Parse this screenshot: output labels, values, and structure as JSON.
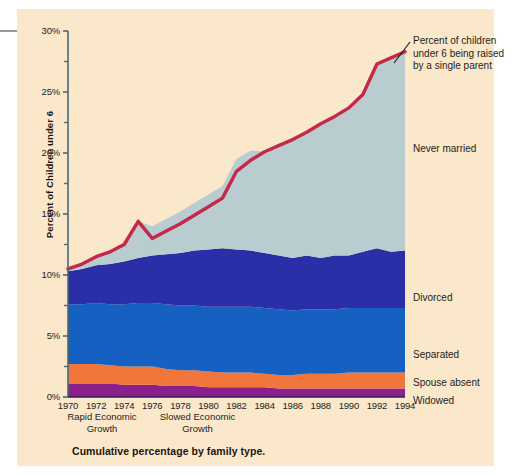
{
  "figure": {
    "caption": "Cumulative percentage by family type.",
    "y_axis_title": "Percent of Children under 6",
    "callout": "Percent of children under 6 being raised by a single parent",
    "era_notes": [
      {
        "line1": "Rapid Economic",
        "line2": "Growth"
      },
      {
        "line1": "Slowed Economic",
        "line2": "Growth"
      }
    ]
  },
  "colors": {
    "panel_background": "#fbe7c9",
    "never_married": "#b9cdd0",
    "divorced": "#2a2fa8",
    "separated": "#1560c0",
    "spouse_absent": "#f0763c",
    "widowed": "#8b1f8c",
    "trend_line": "#c2294a",
    "axis": "#4a6a78",
    "text": "#231f1c",
    "top_rule": "#9a9a9a"
  },
  "chart_data": {
    "type": "area",
    "title": "Cumulative percentage by family type.",
    "xlabel": "",
    "ylabel": "Percent of Children under 6",
    "xlim": [
      1970,
      1994
    ],
    "ylim": [
      0,
      30
    ],
    "ytick_labels": [
      "0%",
      "5%",
      "10%",
      "15%",
      "20%",
      "25%",
      "30%"
    ],
    "ytick_values": [
      0,
      5,
      10,
      15,
      20,
      25,
      30
    ],
    "yminor_values": [
      2.5,
      7.5,
      12.5,
      17.5,
      22.5,
      27.5
    ],
    "xtick_labels": [
      "1970",
      "1972",
      "1974",
      "1976",
      "1978",
      "1980",
      "1982",
      "1984",
      "1986",
      "1988",
      "1990",
      "1992",
      "1994"
    ],
    "xtick_values": [
      1970,
      1972,
      1974,
      1976,
      1978,
      1980,
      1982,
      1984,
      1986,
      1988,
      1990,
      1992,
      1994
    ],
    "grid": false,
    "legend_position": "right-inline",
    "x": [
      1970,
      1971,
      1972,
      1973,
      1974,
      1975,
      1976,
      1977,
      1978,
      1979,
      1980,
      1981,
      1982,
      1983,
      1984,
      1985,
      1986,
      1987,
      1988,
      1989,
      1990,
      1991,
      1992,
      1993,
      1994
    ],
    "series": [
      {
        "name": "Widowed",
        "color": "#8b1f8c",
        "values": [
          1.1,
          1.1,
          1.1,
          1.1,
          1.0,
          1.0,
          1.0,
          0.9,
          0.9,
          0.9,
          0.8,
          0.8,
          0.8,
          0.8,
          0.8,
          0.7,
          0.7,
          0.7,
          0.7,
          0.7,
          0.7,
          0.7,
          0.7,
          0.7,
          0.7
        ]
      },
      {
        "name": "Spouse absent",
        "color": "#f0763c",
        "values": [
          1.6,
          1.6,
          1.6,
          1.5,
          1.5,
          1.5,
          1.5,
          1.4,
          1.3,
          1.3,
          1.3,
          1.2,
          1.2,
          1.2,
          1.1,
          1.1,
          1.1,
          1.2,
          1.2,
          1.2,
          1.3,
          1.3,
          1.3,
          1.3,
          1.3
        ]
      },
      {
        "name": "Separated",
        "color": "#1560c0",
        "values": [
          4.9,
          4.9,
          5.0,
          5.0,
          5.1,
          5.2,
          5.2,
          5.3,
          5.3,
          5.3,
          5.3,
          5.4,
          5.4,
          5.4,
          5.4,
          5.4,
          5.3,
          5.3,
          5.3,
          5.3,
          5.3,
          5.3,
          5.3,
          5.3,
          5.3
        ]
      },
      {
        "name": "Divorced",
        "color": "#2a2fa8",
        "values": [
          2.7,
          2.9,
          3.1,
          3.3,
          3.5,
          3.7,
          3.9,
          4.1,
          4.3,
          4.5,
          4.7,
          4.8,
          4.7,
          4.6,
          4.5,
          4.4,
          4.3,
          4.4,
          4.2,
          4.4,
          4.3,
          4.6,
          4.9,
          4.6,
          4.7
        ]
      },
      {
        "name": "Never married",
        "color": "#b9cdd0",
        "values": [
          0.2,
          0.4,
          0.7,
          1.0,
          1.4,
          3.0,
          2.4,
          2.9,
          3.4,
          3.9,
          4.5,
          5.1,
          7.4,
          8.2,
          8.3,
          9.0,
          9.7,
          10.1,
          11.0,
          11.4,
          12.1,
          12.9,
          15.1,
          15.9,
          16.3
        ]
      }
    ],
    "trend_line": {
      "name": "Percent of children under 6 being raised by a single parent",
      "color": "#c2294a",
      "values": [
        10.5,
        10.9,
        11.5,
        11.9,
        12.5,
        14.4,
        13.0,
        13.6,
        14.2,
        14.9,
        15.6,
        16.3,
        18.5,
        19.4,
        20.1,
        20.6,
        21.1,
        21.7,
        22.4,
        23.0,
        23.7,
        24.8,
        27.3,
        27.8,
        28.3
      ]
    }
  },
  "series_labels": [
    {
      "name": "never-married",
      "text": "Never married"
    },
    {
      "name": "divorced",
      "text": "Divorced"
    },
    {
      "name": "separated",
      "text": "Separated"
    },
    {
      "name": "spouse-absent",
      "text": "Spouse absent"
    },
    {
      "name": "widowed",
      "text": "Widowed"
    }
  ]
}
